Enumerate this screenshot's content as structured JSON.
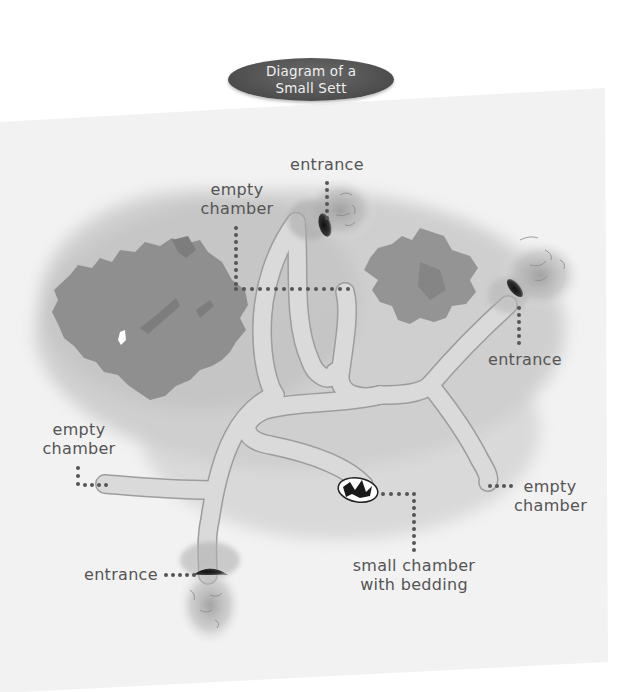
{
  "title": {
    "line1": "Diagram of a",
    "line2": "Small Sett"
  },
  "labels": {
    "entrance_top": "entrance",
    "empty_chamber_top": {
      "line1": "empty",
      "line2": "chamber"
    },
    "entrance_right": "entrance",
    "empty_chamber_left": {
      "line1": "empty",
      "line2": "chamber"
    },
    "empty_chamber_right": {
      "line1": "empty",
      "line2": "chamber"
    },
    "entrance_bottom": "entrance",
    "bedding_chamber": {
      "line1": "small chamber",
      "line2": "with bedding"
    }
  },
  "colors": {
    "card": "#f2f2f2",
    "ground_shadow": "#c4c4c4",
    "tunnel_fill": "#dcdcdc",
    "tunnel_edge": "#9a9a9a",
    "tree": "#8e8e8e",
    "tree_dark": "#7a7a7a",
    "leader_dots": "#555555",
    "title_bubble": "#555555",
    "label_text": "#555555"
  }
}
